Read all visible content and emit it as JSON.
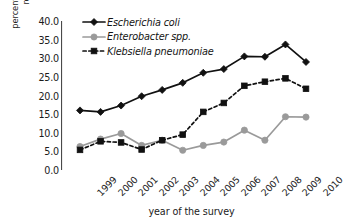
{
  "chart_data": {
    "type": "line",
    "title": "",
    "xlabel": "year of the survey",
    "ylabel": "percentage of fluoroquinolone-resistant infections",
    "ylabel_lines": [
      "percentage of fluoroquinolone-",
      "resistant infections"
    ],
    "categories": [
      "1999",
      "2000",
      "2001",
      "2002",
      "2003",
      "2004",
      "2005",
      "2006",
      "2007",
      "2008",
      "2009",
      "2010"
    ],
    "x": [
      1999,
      2000,
      2001,
      2002,
      2003,
      2004,
      2005,
      2006,
      2007,
      2008,
      2009,
      2010
    ],
    "ylim": [
      0.0,
      40.0
    ],
    "ytick_labels": [
      "40.0",
      "35.0",
      "30.0",
      "25.0",
      "20.0",
      "15.0",
      "10.0",
      "5.0",
      "0.0"
    ],
    "ytick_values": [
      40.0,
      35.0,
      30.0,
      25.0,
      20.0,
      15.0,
      10.0,
      5.0,
      0.0
    ],
    "ytick_step": 5.0,
    "grid": false,
    "legend_position": "upper-left-inside",
    "series": [
      {
        "name": "Escherichia coli",
        "color": "#111111",
        "marker": "diamond",
        "linestyle": "solid",
        "values": [
          16.0,
          15.6,
          17.3,
          19.8,
          21.5,
          23.4,
          26.1,
          27.1,
          30.5,
          30.4,
          33.7,
          29.0
        ]
      },
      {
        "name": "Enterobacter spp.",
        "color": "#9a9a9a",
        "marker": "circle",
        "linestyle": "solid",
        "values": [
          6.3,
          8.3,
          9.8,
          6.6,
          8.0,
          5.3,
          6.6,
          7.5,
          10.7,
          8.0,
          14.3,
          14.2
        ]
      },
      {
        "name": "Klebsiella pneumoniae",
        "color": "#111111",
        "marker": "square",
        "linestyle": "dashed",
        "values": [
          5.4,
          7.7,
          7.4,
          5.5,
          8.0,
          9.5,
          15.6,
          18.0,
          22.6,
          23.7,
          24.6,
          21.8
        ]
      }
    ]
  },
  "legend": {
    "items": [
      {
        "label": "Escherichia coli"
      },
      {
        "label": "Enterobacter spp."
      },
      {
        "label": "Klebsiella pneumoniae"
      }
    ]
  },
  "axes": {
    "y_title_line1": "percentage of fluoroquinolone-",
    "y_title_line2": "resistant infections",
    "x_title": "year of the survey"
  }
}
